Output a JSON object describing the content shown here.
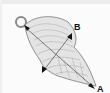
{
  "diagram": {
    "colors": {
      "background": "#fbfbfb",
      "shell_fill": "#e4e4e4",
      "shell_stroke": "#777777",
      "arrow": "#111111"
    },
    "dimensions": [
      {
        "label": "A",
        "description": "length from loop to tip"
      },
      {
        "label": "B",
        "description": "width across shell"
      }
    ]
  }
}
